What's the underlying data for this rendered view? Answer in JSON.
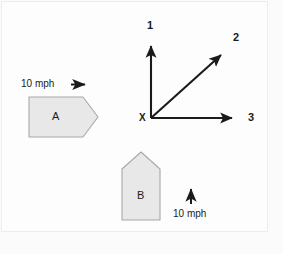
{
  "figure": {
    "background_color": "#fbfbfb",
    "page_background_color": "#f4f4f4",
    "shape_fill_color": "#e8e8e8",
    "shape_stroke_color": "#a8a8a8",
    "ink_color": "#1b1b1b"
  },
  "axes": {
    "origin_label": "X",
    "directions": [
      {
        "id": "1",
        "label": "1",
        "orientation": "up",
        "angle_deg": 90
      },
      {
        "id": "2",
        "label": "2",
        "orientation": "diagonal",
        "angle_deg": 45
      },
      {
        "id": "3",
        "label": "3",
        "orientation": "right",
        "angle_deg": 0
      }
    ]
  },
  "shapes": [
    {
      "id": "A",
      "label": "A",
      "kind": "pentagon-pointing-right",
      "speed_label": "10 mph",
      "speed_value": 10,
      "speed_unit": "mph",
      "direction_arrow": "right"
    },
    {
      "id": "B",
      "label": "B",
      "kind": "pentagon-pointing-up",
      "speed_label": "10 mph",
      "speed_value": 10,
      "speed_unit": "mph",
      "direction_arrow": "up"
    }
  ]
}
